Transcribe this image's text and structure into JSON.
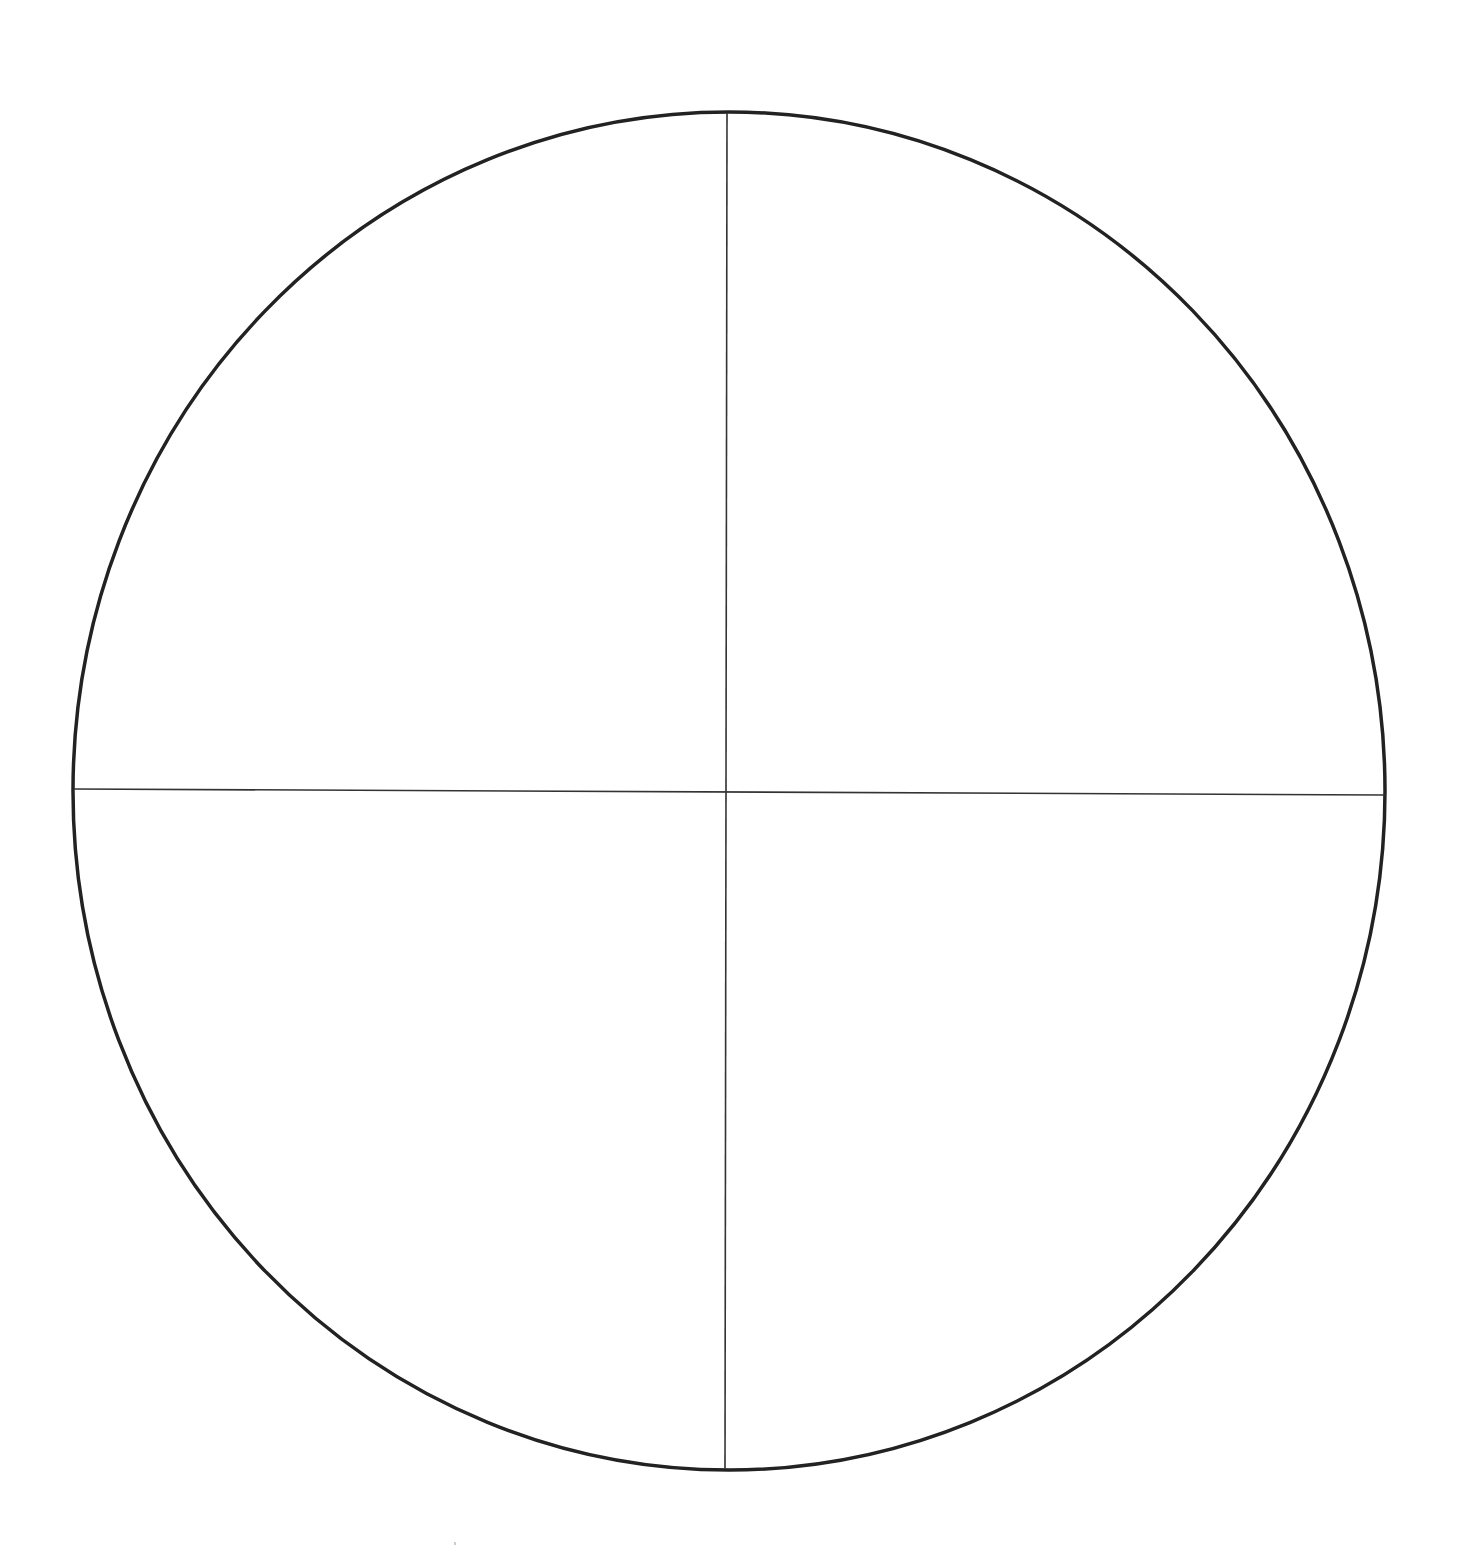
{
  "diagram": {
    "type": "quartered-circle",
    "canvas": {
      "width": 1457,
      "height": 1548,
      "background": "#ffffff"
    },
    "circle": {
      "cx": 729,
      "cy": 791,
      "rx": 656,
      "ry": 679,
      "stroke": "#222222",
      "stroke_width": 3.5
    },
    "vertical_divider": {
      "x1": 727,
      "y1": 113,
      "x2": 725,
      "y2": 1469,
      "stroke": "#333333",
      "stroke_width": 1.6
    },
    "horizontal_divider": {
      "x1": 74,
      "y1": 789,
      "x2": 1385,
      "y2": 795,
      "stroke": "#333333",
      "stroke_width": 1.6
    },
    "quadrants": [
      {
        "id": "top-left",
        "label": ""
      },
      {
        "id": "top-right",
        "label": ""
      },
      {
        "id": "bottom-left",
        "label": ""
      },
      {
        "id": "bottom-right",
        "label": ""
      }
    ],
    "stray_mark": {
      "x": 455,
      "y": 1545
    }
  }
}
